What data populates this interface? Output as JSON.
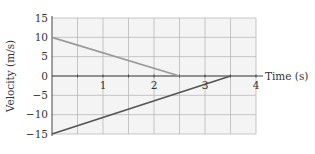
{
  "chart_data": {
    "type": "line",
    "title": "",
    "xlabel": "Time (s)",
    "ylabel": "Velocity (m/s)",
    "xlim": [
      0,
      4
    ],
    "ylim": [
      -15,
      15
    ],
    "x_ticks": [
      1,
      2,
      3,
      4
    ],
    "x_tick_labels": [
      "1",
      "2",
      "3",
      "4"
    ],
    "y_ticks": [
      15,
      10,
      5,
      0,
      -5,
      -10,
      -15
    ],
    "y_tick_labels": [
      "15",
      "10",
      "5",
      "0",
      "−5",
      "−10",
      "−15"
    ],
    "x_grid_step": 0.5,
    "y_grid_step": 5,
    "grid": true,
    "grid_color": "#b9b9b9",
    "background_color": "#f4f4f4",
    "series": [
      {
        "name": "line-a",
        "color": "#9a9a9a",
        "points": [
          [
            0,
            10
          ],
          [
            2.5,
            0
          ]
        ]
      },
      {
        "name": "line-b",
        "color": "#555555",
        "points": [
          [
            0,
            -15
          ],
          [
            3.5,
            0
          ]
        ]
      }
    ]
  }
}
